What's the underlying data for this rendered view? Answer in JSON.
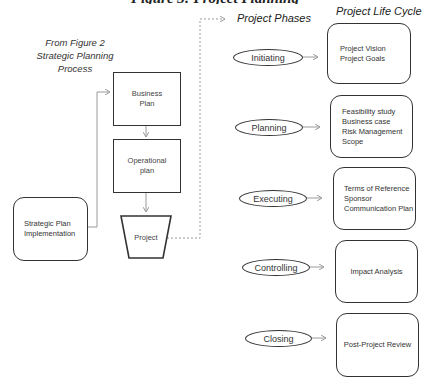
{
  "title_cutoff": "Figure 3: Project Planning",
  "left": {
    "caption_line1": "From Figure 2",
    "caption_line2": "Strategic Planning Process",
    "strategic_box": {
      "line1": "Strategic Plan",
      "line2": "Implementation"
    },
    "business_plan": {
      "line1": "Business",
      "line2": "Plan"
    },
    "operational_plan": {
      "line1": "Operational",
      "line2": "plan"
    },
    "project": "Project"
  },
  "headings": {
    "phases": "Project Phases",
    "life_cycle": "Project Life Cycle"
  },
  "phases": [
    {
      "name": "Initiating",
      "items": [
        "Project Vision",
        "Project Goals"
      ]
    },
    {
      "name": "Planning",
      "items": [
        "Feasibility study",
        "Business case",
        "Risk Management",
        "Scope"
      ]
    },
    {
      "name": "Executing",
      "items": [
        "Terms of Reference",
        "Sponsor",
        "Communication Plan"
      ]
    },
    {
      "name": "Controlling",
      "items": [
        "Impact Analysis"
      ]
    },
    {
      "name": "Closing",
      "items": [
        "Post-Project Review"
      ]
    }
  ],
  "colors": {
    "stroke": "#333333",
    "connector": "#9a9a9a",
    "background": "#ffffff"
  }
}
